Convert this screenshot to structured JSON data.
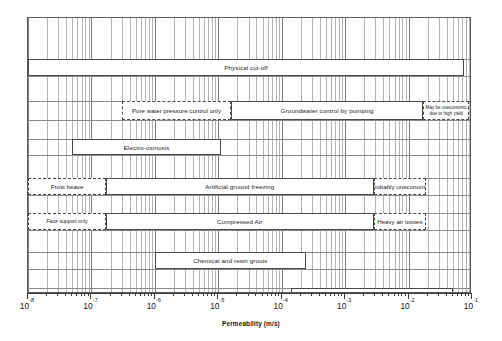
{
  "chart_data": {
    "type": "bar",
    "title": "",
    "xlabel": "Permeability (m/s)",
    "ylabel": "",
    "scale": "log",
    "xlim": [
      1e-08,
      0.1
    ],
    "grid": true,
    "legend": false,
    "xticks": [
      {
        "label": "10",
        "exponent": "-8",
        "value": 1e-08
      },
      {
        "label": "10",
        "exponent": "-7",
        "value": 1e-07
      },
      {
        "label": "10",
        "exponent": "-6",
        "value": 1e-06
      },
      {
        "label": "10",
        "exponent": "-5",
        "value": 1e-05
      },
      {
        "label": "10",
        "exponent": "-4",
        "value": 0.0001
      },
      {
        "label": "10",
        "exponent": "-3",
        "value": 0.001
      },
      {
        "label": "10",
        "exponent": "-2",
        "value": 0.01
      },
      {
        "label": "10",
        "exponent": "-1",
        "value": 0.1
      }
    ],
    "bars": [
      {
        "name": "physical-cut-off",
        "label": "Physical cut-off",
        "x_start": 1e-08,
        "x_end": 0.075,
        "row": 0,
        "style": "solid"
      },
      {
        "name": "pore-water-pressure",
        "label": "Pore water pressure control only",
        "x_start": 3e-07,
        "x_end": 1.6e-05,
        "row": 1,
        "style": "dashed"
      },
      {
        "name": "groundwater-pumping",
        "label": "Groundwater control by pumping",
        "x_start": 1.6e-05,
        "x_end": 0.017,
        "row": 1,
        "style": "solid"
      },
      {
        "name": "may-be-uneconomic",
        "label": "May be uneconomic\ndue to high yield",
        "line1": "May be uneconomic",
        "line2": "due to high yield",
        "x_start": 0.017,
        "x_end": 0.09,
        "row": 1,
        "style": "dashed"
      },
      {
        "name": "electro-osmosis",
        "label": "Electro-osmosis",
        "x_start": 5e-08,
        "x_end": 1.1e-05,
        "row": 2,
        "style": "solid"
      },
      {
        "name": "frost-heave",
        "label": "Frost heave",
        "x_start": 1e-08,
        "x_end": 1.7e-07,
        "row": 3,
        "style": "dashed"
      },
      {
        "name": "artificial-ground-freezing",
        "label": "Artificial ground freezing",
        "x_start": 1.7e-07,
        "x_end": 0.0028,
        "row": 3,
        "style": "solid"
      },
      {
        "name": "probably-uneconomic",
        "label": "Probably uneconomic",
        "x_start": 0.0028,
        "x_end": 0.019,
        "row": 3,
        "style": "dashed"
      },
      {
        "name": "face-support-only",
        "label": "Face support only",
        "x_start": 1e-08,
        "x_end": 1.7e-07,
        "row": 4,
        "style": "dashed"
      },
      {
        "name": "compressed-air",
        "label": "Compressed Air",
        "x_start": 1.7e-07,
        "x_end": 0.0028,
        "row": 4,
        "style": "solid"
      },
      {
        "name": "heavy-air-losses",
        "label": "Heavy air losses",
        "x_start": 0.0028,
        "x_end": 0.019,
        "row": 4,
        "style": "dashed"
      },
      {
        "name": "chemical-and-resin-grouts",
        "label": "Chemical and resin grouts",
        "x_start": 1e-06,
        "x_end": 0.00024,
        "row": 5,
        "style": "solid"
      },
      {
        "name": "cement-based-grouts",
        "label": "Cement based grouts",
        "x_start": 0.00014,
        "x_end": 0.05,
        "row": 6,
        "style": "solid"
      }
    ],
    "rows": [
      {
        "index": 0,
        "top": 41,
        "height": 17
      },
      {
        "index": 1,
        "top": 83,
        "height": 19
      },
      {
        "index": 2,
        "top": 121,
        "height": 16
      },
      {
        "index": 3,
        "top": 160,
        "height": 17
      },
      {
        "index": 4,
        "top": 195,
        "height": 17
      },
      {
        "index": 5,
        "top": 234,
        "height": 17
      },
      {
        "index": 6,
        "top": 270,
        "height": 17
      }
    ]
  },
  "colors": {
    "frame": "#5a5a5a",
    "gridline": "#b4b4b4",
    "gridline_major": "#7d7d7d",
    "bar_border": "#4a4a4a",
    "text": "#1a1a1a",
    "background": "#ffffff"
  }
}
